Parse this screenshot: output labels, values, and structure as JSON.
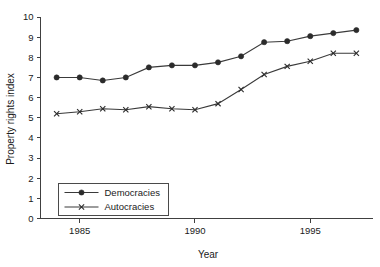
{
  "chart_data": {
    "type": "line",
    "title": "",
    "xlabel": "Year",
    "ylabel": "Property rights index",
    "xlim": [
      1983.3,
      1997.7
    ],
    "ylim": [
      0,
      10
    ],
    "grid": false,
    "legend_position": "bottom-left",
    "x": [
      1984,
      1985,
      1986,
      1987,
      1988,
      1989,
      1990,
      1991,
      1992,
      1993,
      1994,
      1995,
      1996,
      1997
    ],
    "xticks": [
      1985,
      1990,
      1995
    ],
    "xticklabels": [
      "1985",
      "1990",
      "1995"
    ],
    "yticks": [
      0,
      1,
      2,
      3,
      4,
      5,
      6,
      7,
      8,
      9,
      10
    ],
    "yticklabels": [
      "0",
      "1",
      "2",
      "3",
      "4",
      "5",
      "6",
      "7",
      "8",
      "9",
      "10"
    ],
    "series": [
      {
        "name": "Democracies",
        "marker": "circle",
        "color": "#2b2b2b",
        "values": [
          7.0,
          7.0,
          6.85,
          7.0,
          7.5,
          7.6,
          7.6,
          7.75,
          8.05,
          8.75,
          8.8,
          9.05,
          9.2,
          9.35
        ]
      },
      {
        "name": "Autocracies",
        "marker": "x",
        "color": "#2b2b2b",
        "values": [
          5.2,
          5.3,
          5.45,
          5.4,
          5.55,
          5.45,
          5.4,
          5.7,
          6.4,
          7.15,
          7.55,
          7.8,
          8.2,
          8.2
        ]
      }
    ]
  },
  "legend": {
    "entries": [
      {
        "label": "Democracies"
      },
      {
        "label": "Autocracies"
      }
    ]
  },
  "axes": {
    "y_title": "Property rights index",
    "x_title": "Year"
  }
}
